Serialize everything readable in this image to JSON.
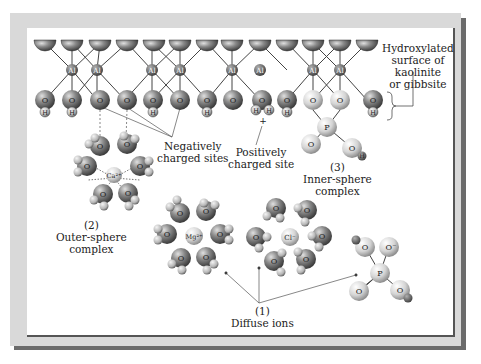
{
  "labels": {
    "hydroxylated": [
      "Hydroxylated",
      "surface of",
      "kaolinite",
      "or gibbsite"
    ],
    "negative": [
      "Negatively",
      "charged sites"
    ],
    "positive": [
      "Positively",
      "charged site"
    ],
    "inner": [
      "(3)",
      "Inner-sphere",
      "complex"
    ],
    "outer": [
      "(2)",
      "Outer-sphere",
      "complex"
    ],
    "diffuse": [
      "(1)",
      "Diffuse ions"
    ]
  },
  "atoms": {
    "al": "Al",
    "o": "O",
    "h": "H",
    "p": "P",
    "o_minus": "O⁻",
    "ca": "Ca²⁺",
    "mg": "Mg²⁺",
    "cl": "Cl⁻",
    "plus": "+"
  },
  "colors": {
    "dark_sphere": "#6e6e6e",
    "light_sphere": "#d6d6d6",
    "frame": "#d9d9d9",
    "frame_shadow": "#6b6b6b"
  }
}
